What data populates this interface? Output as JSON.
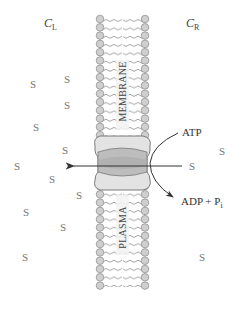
{
  "diagram": {
    "compartments": {
      "left": {
        "symbol": "C",
        "subscript": "L"
      },
      "right": {
        "symbol": "C",
        "subscript": "R"
      }
    },
    "membrane": {
      "top_label": "MEMBRANE",
      "bottom_label": "PLASMA"
    },
    "reaction": {
      "input": "ATP",
      "output_main": "ADP + P",
      "output_sub": "i"
    },
    "solute_symbol": "S",
    "solutes_left": [
      {
        "x": 30,
        "y": 85
      },
      {
        "x": 64,
        "y": 80
      },
      {
        "x": 64,
        "y": 106
      },
      {
        "x": 33,
        "y": 128
      },
      {
        "x": 62,
        "y": 151
      },
      {
        "x": 14,
        "y": 167
      },
      {
        "x": 49,
        "y": 180
      },
      {
        "x": 76,
        "y": 196
      },
      {
        "x": 23,
        "y": 213
      },
      {
        "x": 60,
        "y": 228
      },
      {
        "x": 22,
        "y": 258
      }
    ],
    "solutes_right": [
      {
        "x": 219,
        "y": 152
      },
      {
        "x": 189,
        "y": 167
      },
      {
        "x": 199,
        "y": 258
      }
    ],
    "colors": {
      "lipid_head": "#c8c8c8",
      "lipid_head_stroke": "#8a8a8a",
      "tail": "#8a8a8a",
      "protein_light": "#e2e2e2",
      "protein_dark": "#bdbdbd",
      "arrow": "#333333"
    }
  }
}
